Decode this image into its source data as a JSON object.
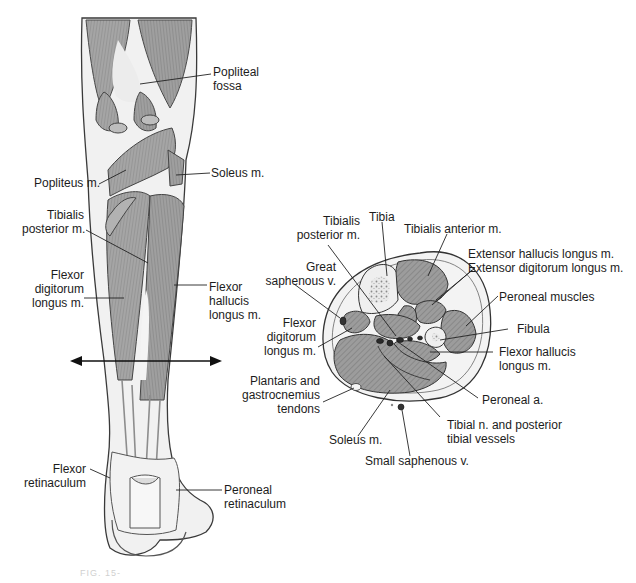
{
  "figure": {
    "type": "anatomical-illustration",
    "colors": {
      "muscle": "#9a9a9a",
      "muscle_dark": "#6e6e6e",
      "tendon": "#e6e6e6",
      "outline": "#3a3a3a",
      "background": "#ffffff"
    }
  },
  "posterior_view": {
    "labels": {
      "popliteal_fossa": [
        "Popliteal",
        "fossa"
      ],
      "popliteus": [
        "Popliteus m."
      ],
      "soleus": [
        "Soleus m."
      ],
      "tibialis_posterior": [
        "Tibialis",
        "posterior m."
      ],
      "flexor_digitorum_longus": [
        "Flexor",
        "digitorum",
        "longus m."
      ],
      "flexor_hallucis_longus": [
        "Flexor",
        "hallucis",
        "longus m."
      ],
      "flexor_retinaculum": [
        "Flexor",
        "retinaculum"
      ],
      "peroneal_retinaculum": [
        "Peroneal",
        "retinaculum"
      ]
    },
    "section_plane_arrow": "double-headed horizontal arrow indicating cross-section level"
  },
  "cross_section": {
    "labels": {
      "tibialis_posterior": [
        "Tibialis",
        "posterior m."
      ],
      "tibia": [
        "Tibia"
      ],
      "tibialis_anterior": [
        "Tibialis anterior m."
      ],
      "extensors": [
        "Extensor hallucis longus m.",
        "Extensor digitorum longus m."
      ],
      "great_saphenous": [
        "Great",
        "saphenous v."
      ],
      "peroneal_muscles": [
        "Peroneal muscles"
      ],
      "flexor_digitorum_longus": [
        "Flexor",
        "digitorum",
        "longus m."
      ],
      "fibula": [
        "Fibula"
      ],
      "flexor_hallucis_longus": [
        "Flexor hallucis",
        "longus m."
      ],
      "plantaris_gastrocnemius": [
        "Plantaris and",
        "gastrocnemius",
        "tendons"
      ],
      "peroneal_artery": [
        "Peroneal a."
      ],
      "tibial_nerve": [
        "Tibial n. and posterior",
        "tibial vessels"
      ],
      "soleus": [
        "Soleus m."
      ],
      "small_saphenous": [
        "Small saphenous v."
      ]
    }
  },
  "caption": "FIG. 15-"
}
